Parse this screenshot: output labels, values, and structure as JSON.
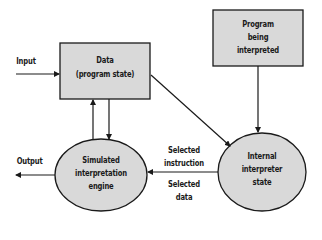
{
  "diagram": {
    "nodes": [
      {
        "id": "data",
        "shape": "rect",
        "lines": [
          "Data",
          "(program state)"
        ]
      },
      {
        "id": "program",
        "shape": "rect",
        "lines": [
          "Program",
          "being",
          "interpreted"
        ]
      },
      {
        "id": "engine",
        "shape": "ellipse",
        "lines": [
          "Simulated",
          "interpretation",
          "engine"
        ]
      },
      {
        "id": "internal",
        "shape": "ellipse",
        "lines": [
          "Internal",
          "interpreter",
          "state"
        ]
      }
    ],
    "edge_labels": {
      "input": "Input",
      "output": "Output",
      "selected_instruction": [
        "Selected",
        "instruction"
      ],
      "selected_data": [
        "Selected",
        "data"
      ]
    },
    "edges": [
      {
        "from": "external",
        "to": "data",
        "label": "Input"
      },
      {
        "from": "engine",
        "to": "external",
        "label": "Output"
      },
      {
        "from": "data",
        "to": "engine"
      },
      {
        "from": "engine",
        "to": "data"
      },
      {
        "from": "data",
        "to": "internal"
      },
      {
        "from": "program",
        "to": "internal"
      },
      {
        "from": "internal",
        "to": "engine",
        "label": "Selected instruction / Selected data"
      }
    ],
    "colors": {
      "fill": "#d9d9d9",
      "stroke": "#1a1a1a"
    }
  }
}
